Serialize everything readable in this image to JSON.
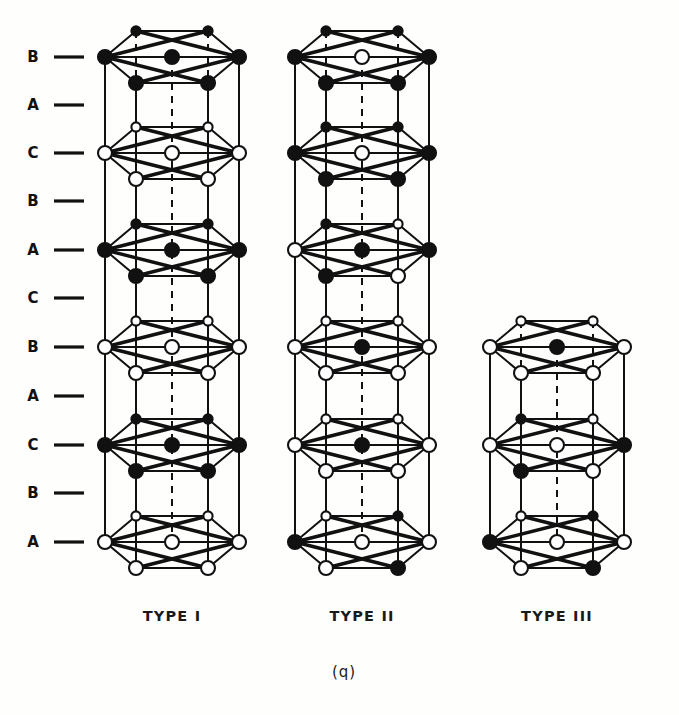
{
  "figure": {
    "caption": "(q)",
    "background_color": "#fefefd",
    "line_color": "#111111",
    "atom_filled_color": "#111111",
    "atom_open_fill": "#ffffff"
  },
  "layer_axis": {
    "name": "stacking-sequence-axis",
    "labels": [
      "B",
      "A",
      "C",
      "B",
      "A",
      "C",
      "B",
      "A",
      "C",
      "B",
      "A"
    ],
    "tick_y": [
      57,
      105,
      153,
      201,
      250,
      298,
      347,
      396,
      445,
      493,
      542
    ],
    "label_x": 33,
    "tick_x1": 54,
    "tick_x2": 84
  },
  "columns": [
    {
      "id": "type-1",
      "label": "TYPE I",
      "label_x": 172,
      "label_y": 617,
      "cx": 172,
      "half_width": 67,
      "top_y": 33,
      "bottom_y": 578,
      "n_layers": 6,
      "layer_pitch": 97,
      "layers": [
        {
          "y": 57,
          "corners": [
            "filled",
            "filled",
            "filled",
            "filled",
            "filled",
            "filled"
          ],
          "center": "filled"
        },
        {
          "y": 153,
          "corners": [
            "open",
            "open",
            "open",
            "open",
            "open",
            "open"
          ],
          "center": "open"
        },
        {
          "y": 250,
          "corners": [
            "filled",
            "filled",
            "filled",
            "filled",
            "filled",
            "filled"
          ],
          "center": "filled"
        },
        {
          "y": 347,
          "corners": [
            "open",
            "open",
            "open",
            "open",
            "open",
            "open"
          ],
          "center": "open"
        },
        {
          "y": 445,
          "corners": [
            "filled",
            "filled",
            "filled",
            "filled",
            "filled",
            "filled"
          ],
          "center": "filled"
        },
        {
          "y": 542,
          "corners": [
            "open",
            "open",
            "open",
            "open",
            "open",
            "open"
          ],
          "center": "open"
        }
      ]
    },
    {
      "id": "type-2",
      "label": "TYPE II",
      "label_x": 362,
      "label_y": 617,
      "cx": 362,
      "half_width": 67,
      "top_y": 33,
      "bottom_y": 578,
      "n_layers": 6,
      "layer_pitch": 97,
      "layers": [
        {
          "y": 57,
          "corners": [
            "filled",
            "filled",
            "filled",
            "filled",
            "filled",
            "filled"
          ],
          "center": "open"
        },
        {
          "y": 153,
          "corners": [
            "filled",
            "filled",
            "filled",
            "filled",
            "filled",
            "filled"
          ],
          "center": "open"
        },
        {
          "y": 250,
          "corners": [
            "open",
            "filled",
            "open",
            "filled",
            "open",
            "filled"
          ],
          "center": "filled"
        },
        {
          "y": 347,
          "corners": [
            "open",
            "open",
            "open",
            "open",
            "open",
            "open"
          ],
          "center": "filled"
        },
        {
          "y": 445,
          "corners": [
            "open",
            "open",
            "open",
            "open",
            "open",
            "open"
          ],
          "center": "filled"
        },
        {
          "y": 542,
          "corners": [
            "filled",
            "open",
            "filled",
            "open",
            "filled",
            "open"
          ],
          "center": "open"
        }
      ]
    },
    {
      "id": "type-3",
      "label": "TYPE III",
      "label_x": 557,
      "label_y": 617,
      "cx": 557,
      "half_width": 67,
      "top_y": 323,
      "bottom_y": 578,
      "n_layers": 3,
      "layer_pitch": 97,
      "layers": [
        {
          "y": 347,
          "corners": [
            "open",
            "open",
            "open",
            "open",
            "open",
            "open"
          ],
          "center": "filled"
        },
        {
          "y": 445,
          "corners": [
            "open",
            "filled",
            "open",
            "filled",
            "open",
            "filled"
          ],
          "center": "open"
        },
        {
          "y": 542,
          "corners": [
            "filled",
            "open",
            "filled",
            "open",
            "filled",
            "open"
          ],
          "center": "open"
        }
      ]
    }
  ],
  "geometry": {
    "hex_dx_outer": 67,
    "hex_dx_inner": 36,
    "hex_dy": 26,
    "atom_radius_large": 7.0,
    "atom_radius_small": 4.6,
    "stroke_width_frame": 2.0,
    "stroke_width_bond": 3.4,
    "stroke_width_dash": 2.0
  }
}
